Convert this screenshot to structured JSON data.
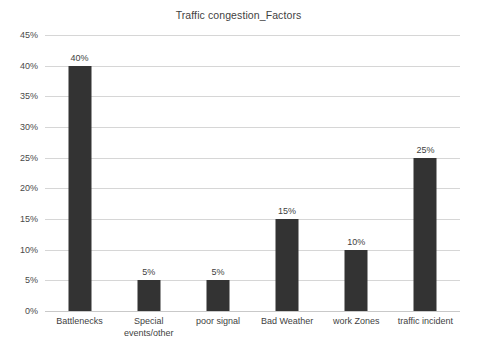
{
  "chart_data": {
    "type": "bar",
    "title": "Traffic congestion_Factors",
    "xlabel": "",
    "ylabel": "",
    "categories": [
      "Battlenecks",
      "Special events/other",
      "poor signal",
      "Bad Weather",
      "work Zones",
      "traffic incident"
    ],
    "values": [
      40,
      5,
      5,
      15,
      10,
      25
    ],
    "value_labels": [
      "40%",
      "5%",
      "5%",
      "15%",
      "10%",
      "25%"
    ],
    "ylim": [
      0,
      45
    ],
    "ytick_values": [
      45,
      40,
      35,
      30,
      25,
      20,
      15,
      10,
      5,
      0
    ],
    "ytick_labels": [
      "45%",
      "40%",
      "35%",
      "30%",
      "25%",
      "20%",
      "15%",
      "10%",
      "5%",
      "0%"
    ],
    "grid": "horizontal",
    "legend": "none",
    "bar_color": "#333333",
    "gridline_color": "#d6d6d6",
    "background_color": "#ffffff",
    "text_color": "#3f3f3f"
  }
}
